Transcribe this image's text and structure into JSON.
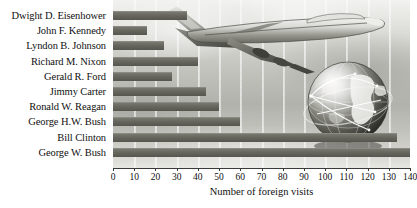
{
  "chart_data": {
    "type": "bar",
    "orientation": "horizontal",
    "title": "",
    "xlabel": "Number of foreign visits",
    "ylabel": "",
    "xlim": [
      0,
      140
    ],
    "xticks": [
      0,
      10,
      20,
      30,
      40,
      50,
      60,
      70,
      80,
      90,
      100,
      110,
      120,
      130,
      140
    ],
    "xtick_labels": [
      "0",
      "10",
      "20",
      "30",
      "40",
      "50",
      "60",
      "70",
      "80",
      "90",
      "100",
      "110",
      "120",
      "130",
      "140"
    ],
    "grid": true,
    "legend": false,
    "categories": [
      "Dwight D. Eisenhower",
      "John F. Kennedy",
      "Lyndon B. Johnson",
      "Richard M. Nixon",
      "Gerald R. Ford",
      "Jimmy Carter",
      "Ronald W. Reagan",
      "George H.W. Bush",
      "Bill Clinton",
      "George W. Bush"
    ],
    "values": [
      35,
      16,
      24,
      40,
      28,
      44,
      50,
      60,
      134,
      140
    ],
    "bar_color": "#66665f"
  },
  "decorations": {
    "airplane": "airplane-illustration",
    "globe": "globe-illustration",
    "background": "sky-photo-backdrop"
  }
}
